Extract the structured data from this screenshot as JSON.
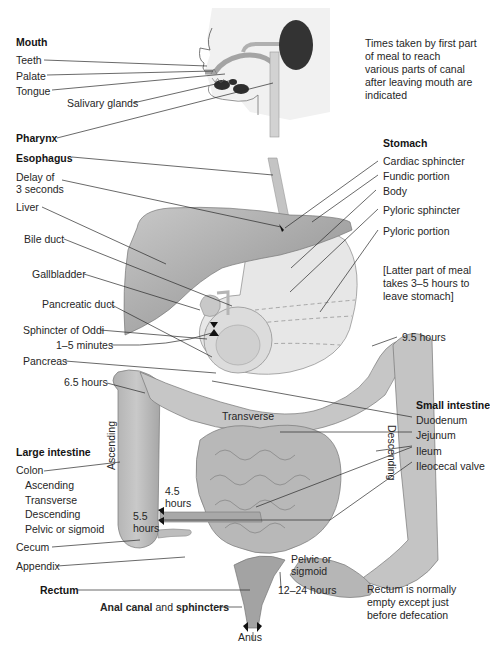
{
  "diagram": {
    "colors": {
      "organ_dark": "#8e8e8e",
      "organ_mid": "#b4b4b4",
      "organ_light": "#d6d6d6",
      "stomach_light": "#e6e6e6",
      "sphincter": "#1a1a1a",
      "leader_line": "#2a2a2a"
    }
  },
  "notes": {
    "times": "Times taken by first part of meal to reach various parts of canal after leaving mouth are indicated",
    "stomach": "[Latter part of meal takes 3–5 hours to leave stomach]",
    "rectum": "Rectum is normally empty except just before defecation"
  },
  "mouth": {
    "header": "Mouth",
    "items": [
      "Teeth",
      "Palate",
      "Tongue"
    ],
    "salivary": "Salivary glands"
  },
  "pharynx": "Pharynx",
  "esophagus": "Esophagus",
  "delay": "Delay of\n3 seconds",
  "delay_line1": "Delay of",
  "delay_line2": "3 seconds",
  "liver_group": {
    "liver": "Liver",
    "bile_duct": "Bile duct",
    "gallbladder": "Gallbladder",
    "pancreatic_duct": "Pancreatic duct",
    "sphincter_oddi": "Sphincter of Oddi",
    "time_duodenum": "1–5 minutes",
    "pancreas": "Pancreas",
    "time_ascending": "6.5 hours"
  },
  "stomach": {
    "header": "Stomach",
    "items": [
      "Cardiac sphincter",
      "Fundic portion",
      "Body",
      "Pyloric sphincter",
      "Pyloric portion"
    ]
  },
  "colon_times": {
    "splenic": "9.5 hours",
    "ileum_4_5": "4.5",
    "ileum_4_5_unit": "hours",
    "cecum_5_5": "5.5",
    "cecum_5_5_unit": "hours",
    "sigmoid": "12–24 hours"
  },
  "small_intestine": {
    "header": "Small intestine",
    "items": [
      "Duodenum",
      "Jejunum",
      "Ileum",
      "Ileocecal valve"
    ]
  },
  "large_intestine": {
    "header": "Large intestine",
    "colon": "Colon",
    "sub": [
      "Ascending",
      "Transverse",
      "Descending",
      "Pelvic or sigmoid"
    ],
    "cecum": "Cecum",
    "appendix": "Appendix"
  },
  "in_diagram": {
    "ascending": "Ascending",
    "transverse": "Transverse",
    "descending": "Descending",
    "pelvic": "Pelvic or",
    "sigmoid": "sigmoid"
  },
  "rectum": "Rectum",
  "anal": {
    "part1": "Anal canal",
    "part2": " and ",
    "part3": "sphincters"
  },
  "anus": "Anus"
}
